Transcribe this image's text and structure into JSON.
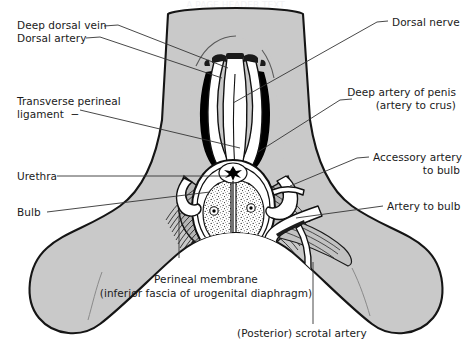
{
  "figure": {
    "title_trimmed": "A PAGE HEADER TEXT",
    "colors": {
      "skin_fill": "#c9c9c9",
      "outline": "#1a1a1a",
      "leader_line": "#333333",
      "black_structure": "#000000",
      "white_structure": "#ffffff",
      "background": "#ffffff",
      "text": "#1a1a1a"
    },
    "labels": {
      "deep_dorsal_vein": "Deep dorsal vein",
      "dorsal_artery": "Dorsal artery",
      "transverse_perineal_ligament_line1": "Transverse perineal",
      "transverse_perineal_ligament_line2": "ligament  −",
      "urethra": "Urethra",
      "bulb": "Bulb",
      "dorsal_nerve": "Dorsal nerve",
      "deep_artery_of_penis_line1": "Deep artery of penis",
      "deep_artery_of_penis_line2": "(artery to crus)",
      "accessory_artery_to_bulb_line1": "Accessory artery",
      "accessory_artery_to_bulb_line2": "to bulb",
      "artery_to_bulb": "Artery to bulb",
      "perineal_membrane_line1": "Perineal membrane",
      "perineal_membrane_line2": "(inferior fascia of urogenital diaphragm)",
      "posterior_scrotal_artery": "(Posterior) scrotal artery"
    }
  }
}
